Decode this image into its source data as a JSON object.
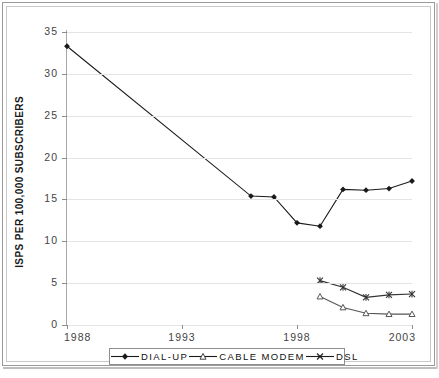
{
  "chart_data": {
    "type": "line",
    "title": "",
    "xlabel": "",
    "ylabel": "ISPS PER 100,000 SUBSCRIBERS",
    "xlim": [
      1988,
      2003
    ],
    "ylim": [
      0,
      35
    ],
    "grid": true,
    "legend_position": "bottom",
    "x_ticks": [
      "1988",
      "1993",
      "1998",
      "2003"
    ],
    "x_tick_values": [
      1988,
      1993,
      1998,
      2003
    ],
    "y_ticks": [
      "0",
      "5",
      "10",
      "15",
      "20",
      "25",
      "30",
      "35"
    ],
    "y_tick_values": [
      0,
      5,
      10,
      15,
      20,
      25,
      30,
      35
    ],
    "series": [
      {
        "name": "DIAL-UP",
        "marker": "filled-diamond",
        "color": "#1a1a1a",
        "x": [
          1988,
          1996,
          1997,
          1998,
          1999,
          2000,
          2001,
          2002,
          2003
        ],
        "values": [
          33.3,
          15.4,
          15.3,
          12.2,
          11.8,
          16.2,
          16.1,
          16.3,
          17.2
        ]
      },
      {
        "name": "CABLE MODEM",
        "marker": "open-triangle",
        "color": "#555555",
        "x": [
          1999,
          2000,
          2001,
          2002,
          2003
        ],
        "values": [
          3.4,
          2.1,
          1.4,
          1.3,
          1.3
        ]
      },
      {
        "name": "DSL",
        "marker": "cross-star",
        "color": "#333333",
        "x": [
          1999,
          2000,
          2001,
          2002,
          2003
        ],
        "values": [
          5.3,
          4.5,
          3.3,
          3.6,
          3.7
        ]
      }
    ]
  },
  "legend": {
    "items": [
      {
        "label": "DIAL-UP"
      },
      {
        "label": "CABLE MODEM"
      },
      {
        "label": "DSL"
      }
    ]
  },
  "axis": {
    "y_title": "ISPS PER 100,000 SUBSCRIBERS"
  }
}
